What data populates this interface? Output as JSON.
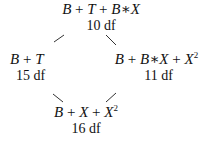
{
  "diagram": {
    "type": "model-lattice",
    "nodes": [
      {
        "id": "top",
        "expression": "B + T + B*X",
        "df": "10 df"
      },
      {
        "id": "left",
        "expression": "B + T",
        "df": "15 df"
      },
      {
        "id": "right",
        "expression": "B + B*X + X^2",
        "df": "11 df"
      },
      {
        "id": "bottom",
        "expression": "B + X + X^2",
        "df": "16 df"
      }
    ],
    "edges": [
      {
        "from": "top",
        "to": "left"
      },
      {
        "from": "top",
        "to": "right"
      },
      {
        "from": "left",
        "to": "bottom"
      },
      {
        "from": "right",
        "to": "bottom"
      }
    ]
  },
  "labels": {
    "top": {
      "p1": "B",
      "o1": "+",
      "p2": "T",
      "o2": "+",
      "p3": "B",
      "o3": "∗",
      "p4": "X",
      "df": "10 df"
    },
    "left": {
      "p1": "B",
      "o1": "+",
      "p2": "T",
      "df": "15 df"
    },
    "right": {
      "p1": "B",
      "o1": "+",
      "p2": "B",
      "o2": "∗",
      "p3": "X",
      "o3": "+",
      "p4": "X",
      "sup": "2",
      "df": "11 df"
    },
    "bottom": {
      "p1": "B",
      "o1": "+",
      "p2": "X",
      "o2": "+",
      "p3": "X",
      "sup": "2",
      "df": "16 df"
    }
  }
}
